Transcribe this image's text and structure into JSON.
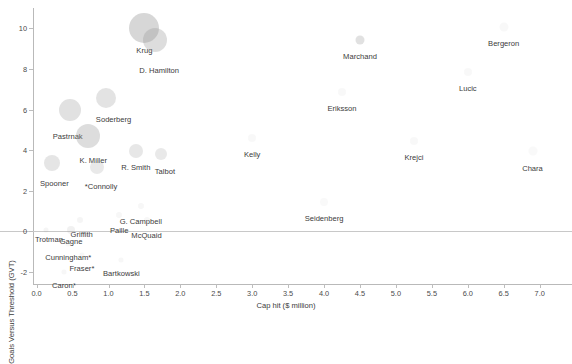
{
  "chart_data": {
    "type": "scatter",
    "title": "",
    "xlabel": "Cap hit ($ million)",
    "ylabel": "Goals Versus Threshold (GVT)",
    "xlim": [
      -0.05,
      7.45
    ],
    "ylim": [
      -2.6,
      11.0
    ],
    "xticks": [
      "0.0",
      "0.5",
      "1.0",
      "1.5",
      "2.0",
      "2.5",
      "3.0",
      "3.5",
      "4.0",
      "4.5",
      "5.0",
      "5.5",
      "6.0",
      "6.5",
      "7.0"
    ],
    "xtick_values": [
      0.0,
      0.5,
      1.0,
      1.5,
      2.0,
      2.5,
      3.0,
      3.5,
      4.0,
      4.5,
      5.0,
      5.5,
      6.0,
      6.5,
      7.0
    ],
    "yticks": [
      "10",
      "8",
      "6",
      "4",
      "2",
      "0",
      "-2"
    ],
    "ytick_values": [
      10,
      8,
      6,
      4,
      2,
      0,
      -2
    ],
    "grid": false,
    "legend": "none",
    "reference_line": {
      "axis": "y",
      "value": 0,
      "color": "#c8c8c8"
    },
    "bubble_color": "#9a9a9a",
    "points": [
      {
        "label": "Krug",
        "x": 1.5,
        "y": 10.0,
        "size": 30,
        "opacity": 0.4,
        "label_dx": 0,
        "label_dy": 18
      },
      {
        "label": "D. Hamilton",
        "x": 1.65,
        "y": 9.45,
        "size": 24,
        "opacity": 0.34,
        "label_dx": 4,
        "label_dy": 26
      },
      {
        "label": "Marchand",
        "x": 4.5,
        "y": 9.45,
        "size": 9,
        "opacity": 0.3,
        "label_dx": 0,
        "label_dy": 12
      },
      {
        "label": "Bergeron",
        "x": 6.5,
        "y": 10.05,
        "size": 9,
        "opacity": 0.07,
        "label_dx": 0,
        "label_dy": 12
      },
      {
        "label": "Lucic",
        "x": 6.0,
        "y": 7.85,
        "size": 8,
        "opacity": 0.07,
        "label_dx": 0,
        "label_dy": 12
      },
      {
        "label": "Eriksson",
        "x": 4.25,
        "y": 6.85,
        "size": 8,
        "opacity": 0.07,
        "label_dx": 0,
        "label_dy": 12
      },
      {
        "label": "Soderberg",
        "x": 0.96,
        "y": 6.55,
        "size": 20,
        "opacity": 0.28,
        "label_dx": 8,
        "label_dy": 17
      },
      {
        "label": "Pastrnak",
        "x": 0.46,
        "y": 6.0,
        "size": 22,
        "opacity": 0.3,
        "label_dx": -2,
        "label_dy": 22
      },
      {
        "label": "Kelly",
        "x": 3.0,
        "y": 4.6,
        "size": 8,
        "opacity": 0.07,
        "label_dx": 0,
        "label_dy": 12
      },
      {
        "label": "Krejci",
        "x": 5.25,
        "y": 4.45,
        "size": 8,
        "opacity": 0.07,
        "label_dx": 0,
        "label_dy": 12
      },
      {
        "label": "K. Miller",
        "x": 0.72,
        "y": 4.7,
        "size": 24,
        "opacity": 0.34,
        "label_dx": 5,
        "label_dy": 20
      },
      {
        "label": "R. Smith",
        "x": 1.38,
        "y": 3.95,
        "size": 14,
        "opacity": 0.24,
        "label_dx": 0,
        "label_dy": 12
      },
      {
        "label": "Talbot",
        "x": 1.73,
        "y": 3.8,
        "size": 12,
        "opacity": 0.22,
        "label_dx": 4,
        "label_dy": 13
      },
      {
        "label": "Chara",
        "x": 6.9,
        "y": 3.95,
        "size": 9,
        "opacity": 0.06,
        "label_dx": 0,
        "label_dy": 13
      },
      {
        "label": "Spooner",
        "x": 0.22,
        "y": 3.35,
        "size": 16,
        "opacity": 0.26,
        "label_dx": 2,
        "label_dy": 16
      },
      {
        "label": "*Connolly",
        "x": 0.84,
        "y": 3.15,
        "size": 14,
        "opacity": 0.22,
        "label_dx": 4,
        "label_dy": 15
      },
      {
        "label": "Seidenberg",
        "x": 4.0,
        "y": 1.45,
        "size": 8,
        "opacity": 0.06,
        "label_dx": 0,
        "label_dy": 12
      },
      {
        "label": "G. Campbell",
        "x": 1.45,
        "y": 1.25,
        "size": 6,
        "opacity": 0.08,
        "label_dx": 0,
        "label_dy": 11
      },
      {
        "label": "Paille",
        "x": 1.15,
        "y": 0.8,
        "size": 6,
        "opacity": 0.08,
        "label_dx": 0,
        "label_dy": 11
      },
      {
        "label": "McQuaid",
        "x": 1.53,
        "y": 0.55,
        "size": 6,
        "opacity": 0.08,
        "label_dx": 0,
        "label_dy": 11
      },
      {
        "label": "Griffith",
        "x": 0.6,
        "y": 0.55,
        "size": 6,
        "opacity": 0.1,
        "label_dx": 2,
        "label_dy": 10
      },
      {
        "label": "Trotman",
        "x": 0.13,
        "y": 0.05,
        "size": 5,
        "opacity": 0.1,
        "label_dx": 3,
        "label_dy": 5
      },
      {
        "label": "Gagne",
        "x": 0.48,
        "y": 0.05,
        "size": 8,
        "opacity": 0.14,
        "label_dx": 0,
        "label_dy": 7
      },
      {
        "label": "Cunningham*",
        "x": 0.44,
        "y": -0.65,
        "size": 5,
        "opacity": 0.08,
        "label_dx": 0,
        "label_dy": 9
      },
      {
        "label": "Fraser*",
        "x": 0.63,
        "y": -1.15,
        "size": 5,
        "opacity": 0.08,
        "label_dx": 0,
        "label_dy": 9
      },
      {
        "label": "Bartkowski",
        "x": 1.18,
        "y": -1.4,
        "size": 5,
        "opacity": 0.08,
        "label_dx": 0,
        "label_dy": 9
      },
      {
        "label": "Caron*",
        "x": 0.38,
        "y": -2.0,
        "size": 5,
        "opacity": 0.08,
        "label_dx": 0,
        "label_dy": 9
      }
    ]
  }
}
